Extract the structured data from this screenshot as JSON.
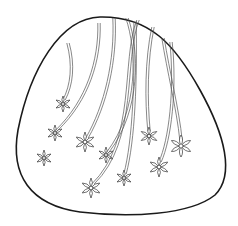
{
  "image": {
    "title": "",
    "description": "Line-art coloring page: rounded egg/triangle shape with hanging flower vines",
    "colors": {
      "background": "#ffffff",
      "outline": "#1a1a1a",
      "stem": "#555555",
      "petal_stroke": "#333333"
    }
  },
  "shape": {
    "path": "M 100 17 C 60 18 30 70 18 130 C 10 175 30 205 80 212 C 130 218 190 215 215 195 C 235 175 225 135 200 90 C 175 45 150 16 100 17 Z"
  },
  "vines": [
    {
      "id": "v1",
      "path": "M 68 43 C 74 65 72 85 64 100",
      "flower": {
        "x": 63,
        "y": 104,
        "r": 8
      }
    },
    {
      "id": "v2",
      "path": "M 99 23 C 100 60 88 100 57 130",
      "flower": {
        "x": 55,
        "y": 133,
        "r": 8
      }
    },
    {
      "id": "v3",
      "path": "",
      "flower": {
        "x": 44,
        "y": 158,
        "r": 8
      }
    },
    {
      "id": "v4",
      "path": "M 114 18 C 116 60 106 105 87 138",
      "flower": {
        "x": 85,
        "y": 142,
        "r": 10
      }
    },
    {
      "id": "v5",
      "path": "M 127 18 C 138 50 140 110 108 152",
      "flower": {
        "x": 106,
        "y": 155,
        "r": 8
      }
    },
    {
      "id": "v6",
      "path": "M 138 20 C 122 60 138 140 93 184",
      "flower": {
        "x": 91,
        "y": 188,
        "r": 10
      }
    },
    {
      "id": "v7",
      "path": "M 135 21 C 136 80 134 140 125 174",
      "flower": {
        "x": 124,
        "y": 178,
        "r": 8
      }
    },
    {
      "id": "v8",
      "path": "M 153 27 C 146 60 146 100 149 131",
      "flower": {
        "x": 149,
        "y": 136,
        "r": 9
      }
    },
    {
      "id": "v9",
      "path": "M 163 38 C 168 70 178 110 181 140",
      "flower": {
        "x": 181,
        "y": 146,
        "r": 11
      }
    },
    {
      "id": "v10",
      "path": "M 171 42 C 176 90 170 140 160 162",
      "flower": {
        "x": 159,
        "y": 167,
        "r": 10
      }
    }
  ]
}
